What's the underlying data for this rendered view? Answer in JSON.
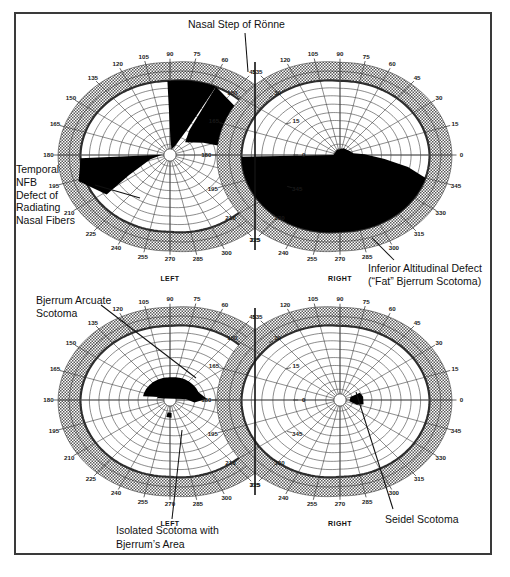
{
  "figure": {
    "title_annotation": "Nasal Step of Rönne",
    "background": "#ffffff",
    "frame_color": "#3a3a3a",
    "defect_fill": "#000000",
    "periphery_fill": "#b8b8b8",
    "grid_color": "#333333"
  },
  "annotations": {
    "nasal_step": "Nasal Step of Rönne",
    "temporal_nfb": "Temporal\nNFB\nDefect of\nRadiating\nNasal Fibers",
    "inferior_altitudinal_line1": "Inferior Altitudinal Defect",
    "inferior_altitudinal_line2": "(“Fat” Bjerrum Scotoma)",
    "bjerrum_arcuate": "Bjerrum Arcuate\nScotoma",
    "isolated_scotoma_line1": "Isolated Scotoma with",
    "isolated_scotoma_line2": "Bjerrum’s Area",
    "seidel_scotoma": "Seidel Scotoma"
  },
  "eye_labels": {
    "left": "LEFT",
    "right": "RIGHT"
  },
  "chart_data": {
    "type": "scatter",
    "subtitle": "Four monocular visual-field plots: upper pair and lower pair, each LEFT and RIGHT eye",
    "xlabel": "Meridian (degrees)",
    "ylabel": "Eccentricity (degrees from fixation)",
    "grid": true,
    "legend_position": "none",
    "coordinate_system": "polar",
    "meridian_ticks_top": [
      120,
      105,
      90,
      75,
      60
    ],
    "meridian_ticks_left": [
      135,
      150,
      165,
      180,
      195,
      210,
      225
    ],
    "meridian_ticks_right": [
      45,
      30,
      15,
      0,
      345,
      330,
      315
    ],
    "meridian_ticks_bottom": [
      240,
      255,
      270,
      285,
      300
    ],
    "meridian_tick_step_deg": 15,
    "radial_rings_deg": [
      10,
      20,
      30,
      40,
      50,
      60,
      70,
      80,
      90
    ],
    "plots": [
      {
        "id": "upper-left",
        "eye": "LEFT",
        "row": "upper",
        "defects": [
          {
            "name": "Nasal Step of Rönne",
            "sector_deg": [
              60,
              105
            ],
            "radius_deg": [
              0,
              60
            ]
          },
          {
            "name": "Temporal NFB Defect of Radiating Nasal Fibers",
            "sector_deg": [
              178,
              215
            ],
            "radius_deg": [
              8,
              90
            ]
          }
        ]
      },
      {
        "id": "upper-right",
        "eye": "RIGHT",
        "row": "upper",
        "defects": [
          {
            "name": "Inferior Altitudinal Defect (“Fat” Bjerrum Scotoma)",
            "sector_deg": [
              180,
              360
            ],
            "radius_deg": [
              0,
              90
            ]
          }
        ]
      },
      {
        "id": "lower-left",
        "eye": "LEFT",
        "row": "lower",
        "defects": [
          {
            "name": "Bjerrum Arcuate Scotoma",
            "sector_deg": [
              160,
              360
            ],
            "radius_deg": [
              5,
              22
            ]
          },
          {
            "name": "Isolated Scotoma with Bjerrum’s Area",
            "sector_deg": [
              255,
              275
            ],
            "radius_deg": [
              14,
              19
            ]
          }
        ]
      },
      {
        "id": "lower-right",
        "eye": "RIGHT",
        "row": "lower",
        "defects": [
          {
            "name": "Seidel Scotoma",
            "sector_deg": [
              330,
              20
            ],
            "radius_deg": [
              6,
              18
            ]
          }
        ]
      }
    ]
  },
  "ticks": {
    "top": [
      "120",
      "105",
      "90",
      "75",
      "60"
    ],
    "left": [
      "135",
      "150",
      "165",
      "180",
      "195",
      "210",
      "225"
    ],
    "right": [
      "45",
      "30",
      "15",
      "0",
      "345",
      "330",
      "315"
    ],
    "bottom": [
      "240",
      "255",
      "270",
      "285",
      "300"
    ]
  }
}
